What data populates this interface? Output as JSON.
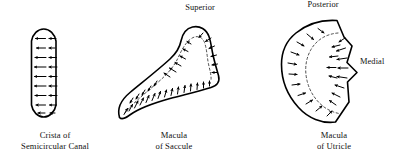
{
  "figure": {
    "background_color": "#ffffff",
    "line_color": "#000000",
    "striola_color": "#3a3a3a",
    "panels": [
      {
        "id": "crista",
        "shape": "stadium",
        "caption_line1": "Crista of",
        "caption_line2": "Semicircular Canal",
        "direction_labels": [],
        "arrow_count": 16,
        "arrow_direction": "left",
        "description": "Pill shaped crista with two columns of arrows all pointing to the left"
      },
      {
        "id": "macula-saccule",
        "shape": "hook",
        "caption_line1": "Macula",
        "caption_line2": "of Saccule",
        "direction_labels": [
          "Superior"
        ],
        "arrow_count": 28,
        "arrow_direction": "away-from-striola",
        "description": "J shaped macula of the saccule with a dashed striola and arrows pointing away from it"
      },
      {
        "id": "macula-utricle",
        "shape": "fan",
        "caption_line1": "Macula",
        "caption_line2": "of Utricle",
        "direction_labels": [
          "Posterior",
          "Medial"
        ],
        "arrow_count": 22,
        "arrow_direction": "toward-striola",
        "description": "Fan shaped macula of the utricle with a notch on the medial edge, dashed striola and arrows pointing toward it"
      }
    ]
  },
  "labels": {
    "superior": "Superior",
    "posterior": "Posterior",
    "medial": "Medial",
    "crista_line1": "Crista of",
    "crista_line2": "Semicircular Canal",
    "saccule_line1": "Macula",
    "saccule_line2": "of Saccule",
    "utricle_line1": "Macula",
    "utricle_line2": "of Utricle"
  }
}
